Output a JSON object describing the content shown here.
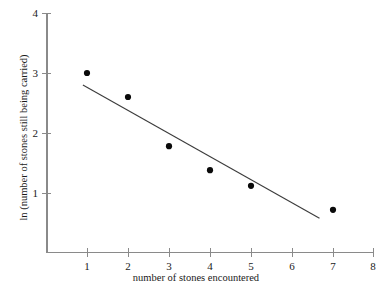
{
  "chart_data": {
    "type": "scatter",
    "title": "",
    "xlabel": "number of stones encountered",
    "ylabel": "ln (number of stones still being carried)",
    "x": [
      1,
      2,
      3,
      4,
      5,
      7
    ],
    "values": [
      3.0,
      2.6,
      1.78,
      1.38,
      1.12,
      0.72
    ],
    "series": [
      {
        "name": "observations",
        "x": [
          1,
          2,
          3,
          4,
          5,
          7
        ],
        "values": [
          3.0,
          2.6,
          1.78,
          1.38,
          1.12,
          0.72
        ]
      },
      {
        "name": "fitted line",
        "type": "line",
        "x": [
          0.9,
          6.67
        ],
        "values": [
          2.8,
          0.58
        ]
      }
    ],
    "xlim": [
      0,
      8
    ],
    "ylim": [
      0,
      4
    ],
    "xticks": [
      1,
      2,
      3,
      4,
      5,
      6,
      7,
      8
    ],
    "yticks": [
      1,
      2,
      3,
      4
    ],
    "xtick_labels": [
      "1",
      "2",
      "3",
      "4",
      "5",
      "6",
      "7",
      "8"
    ],
    "ytick_labels": [
      "1",
      "2",
      "3",
      "4"
    ],
    "grid": false,
    "legend": false,
    "marker_color": "#0a0a0a",
    "line_color": "#3b3b3b",
    "axis_color": "#8a8a8a",
    "background": "#ffffff"
  },
  "axes": {
    "x_title": "number of stones encountered",
    "y_title": "ln (number of stones still being carried)"
  },
  "xticks": [
    {
      "label": "1"
    },
    {
      "label": "2"
    },
    {
      "label": "3"
    },
    {
      "label": "4"
    },
    {
      "label": "5"
    },
    {
      "label": "6"
    },
    {
      "label": "7"
    },
    {
      "label": "8"
    }
  ],
  "yticks": [
    {
      "label": "1"
    },
    {
      "label": "2"
    },
    {
      "label": "3"
    },
    {
      "label": "4"
    }
  ]
}
